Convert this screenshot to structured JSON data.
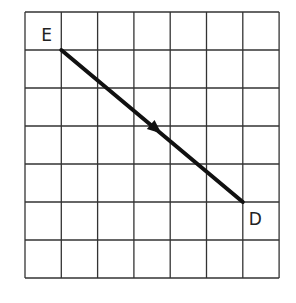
{
  "grid": {
    "columns": 7,
    "rows": 7,
    "left": 25,
    "top": 12,
    "cell_width": 36.3,
    "cell_height": 38,
    "line_color": "#333333"
  },
  "points": {
    "E": {
      "label": "E",
      "grid_x": 1,
      "grid_y": 1
    },
    "D": {
      "label": "D",
      "grid_x": 6,
      "grid_y": 5
    }
  },
  "segment": {
    "from": "E",
    "to": "D",
    "direction_arrow": "toward D",
    "color": "#111111"
  }
}
